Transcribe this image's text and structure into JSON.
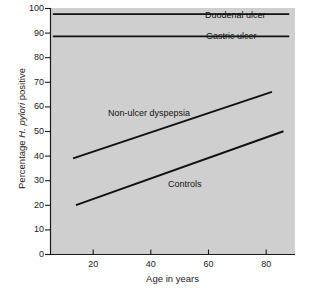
{
  "chart_data": {
    "type": "line",
    "title": "",
    "subtitle": "",
    "xlabel": "Age in years",
    "ylabel": "Percentage H. pylori positive",
    "ylabel_parts": {
      "prefix": "Percentage ",
      "italic": "H. pylori",
      "suffix": " positive"
    },
    "xlim": [
      5,
      90
    ],
    "ylim": [
      0,
      100
    ],
    "xticks": [
      20,
      40,
      60,
      80
    ],
    "xtick_labels": [
      "20",
      "40",
      "60",
      "80"
    ],
    "yticks": [
      0,
      10,
      20,
      30,
      40,
      50,
      60,
      70,
      80,
      90,
      100
    ],
    "ytick_labels": [
      "0",
      "10",
      "20",
      "30",
      "40",
      "50",
      "60",
      "70",
      "80",
      "90",
      "100"
    ],
    "grid": false,
    "legend_position": "inline-annotations",
    "plot_background": "#cfcfcf",
    "line_color": "#111111",
    "series": [
      {
        "name": "Duodenal ulcer",
        "label": "Duodenal ulcer",
        "x": [
          6,
          88
        ],
        "values": [
          97.5,
          97.5
        ]
      },
      {
        "name": "Gastric ulcer",
        "label": "Gastric ulcer",
        "x": [
          6,
          88
        ],
        "values": [
          88.5,
          88.5
        ]
      },
      {
        "name": "Non-ulcer dyspepsia",
        "label": "Non-ulcer dyspepsia",
        "x": [
          13,
          82
        ],
        "values": [
          39,
          66
        ]
      },
      {
        "name": "Controls",
        "label": "Controls",
        "x": [
          14,
          86
        ],
        "values": [
          20,
          50
        ]
      }
    ]
  }
}
